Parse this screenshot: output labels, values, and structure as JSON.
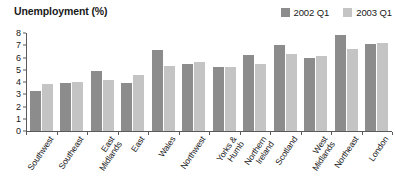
{
  "chart_data": {
    "type": "bar",
    "title": "Unemployment (%)",
    "xlabel": "",
    "ylabel": "",
    "ylim": [
      0,
      8
    ],
    "yticks": [
      8,
      7,
      6,
      5,
      4,
      3,
      2,
      1,
      0
    ],
    "grid": false,
    "legend_position": "top-right",
    "categories": [
      "Southwest",
      "Southeast",
      "East Midlands",
      "East",
      "Wales",
      "Northwest",
      "Yorks & Humb",
      "Northern Ireland",
      "Scotland",
      "West Midlands",
      "Northeast",
      "London"
    ],
    "category_lines": [
      [
        "Southwest"
      ],
      [
        "Southeast"
      ],
      [
        "East",
        "Midlands"
      ],
      [
        "East"
      ],
      [
        "Wales"
      ],
      [
        "Northwest"
      ],
      [
        "Yorks &",
        "Humb"
      ],
      [
        "Northern",
        "Ireland"
      ],
      [
        "Scotland"
      ],
      [
        "West",
        "Midlands"
      ],
      [
        "Northeast"
      ],
      [
        "London"
      ]
    ],
    "series": [
      {
        "name": "2002 Q1",
        "color": "#8c8c8c",
        "values": [
          3.3,
          3.9,
          4.9,
          3.9,
          6.6,
          5.5,
          5.2,
          6.2,
          7.0,
          6.0,
          7.8,
          7.1
        ]
      },
      {
        "name": "2003 Q1",
        "color": "#c4c4c4",
        "values": [
          3.8,
          4.0,
          4.2,
          4.6,
          5.3,
          5.6,
          5.2,
          5.5,
          6.3,
          6.1,
          6.7,
          7.2
        ]
      }
    ]
  },
  "colors": {
    "axis": "#5a5a5a",
    "text": "#1a1a1a",
    "background": "#ffffff"
  }
}
